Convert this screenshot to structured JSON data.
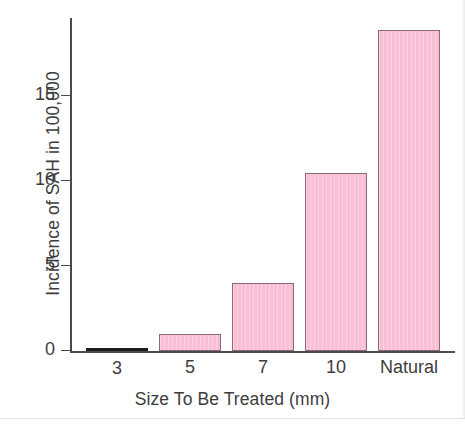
{
  "chart_data": {
    "type": "bar",
    "title": "",
    "xlabel": "Size To Be Treated (mm)",
    "ylabel": "Incidence of SAH in 100,000",
    "categories": [
      "3",
      "5",
      "7",
      "10",
      "Natural"
    ],
    "values": [
      0.1,
      1.0,
      4.0,
      10.4,
      18.8
    ],
    "ylim": [
      0,
      19.5
    ],
    "yticks": [
      0,
      5,
      10,
      15
    ],
    "ytick_labels": [
      "0",
      "5",
      "10",
      "15"
    ],
    "grid": false,
    "legend": false,
    "series": [
      {
        "name": "Incidence of SAH in 100,000",
        "values": [
          0.1,
          1.0,
          4.0,
          10.4,
          18.8
        ]
      }
    ],
    "colors": {
      "bar_fill": "#f9bdd6",
      "bar_edge": "#8a6a79",
      "axis": "#4a4a4a",
      "text": "#3d3d3d",
      "background": "#ffffff",
      "flat_bar": "#1c1c1c"
    }
  },
  "axes": {
    "y_title": "Incidence of SAH in 100,000",
    "x_title": "Size To Be Treated (mm)",
    "y_ticks": [
      {
        "label": "15",
        "value": 15
      },
      {
        "label": "10",
        "value": 10
      },
      {
        "label": "5",
        "value": 5
      },
      {
        "label": "0",
        "value": 0
      }
    ]
  },
  "bars": [
    {
      "label": "3",
      "value": 0.1,
      "flat": true
    },
    {
      "label": "5",
      "value": 1.0,
      "flat": false
    },
    {
      "label": "7",
      "value": 4.0,
      "flat": false
    },
    {
      "label": "10",
      "value": 10.4,
      "flat": false
    },
    {
      "label": "Natural",
      "value": 18.8,
      "flat": false
    }
  ]
}
